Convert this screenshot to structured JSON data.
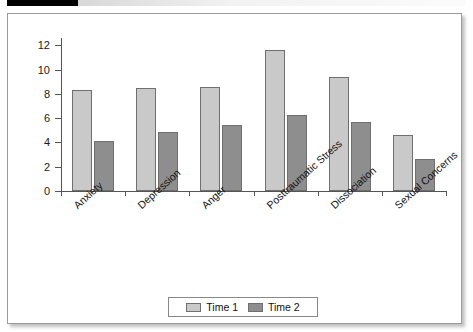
{
  "figure": {
    "marker_bar": "black-tab",
    "background": "#ffffff",
    "border_color": "#9a9a9a"
  },
  "legend": {
    "position": "bottom-center",
    "entries": [
      {
        "label": "Time 1",
        "color": "#c9c9c9"
      },
      {
        "label": "Time 2",
        "color": "#8e8e8e"
      }
    ]
  },
  "chart_data": {
    "type": "bar",
    "title": "",
    "subtitle": "",
    "xlabel": "",
    "ylabel": "",
    "categories": [
      "Anxiety",
      "Depression",
      "Anger",
      "Posttraumatic Stress",
      "Dissociation",
      "Sexual Concerns"
    ],
    "series": [
      {
        "name": "Time 1",
        "color": "#c9c9c9",
        "values": [
          8.3,
          8.5,
          8.6,
          11.6,
          9.35,
          4.65
        ]
      },
      {
        "name": "Time 2",
        "color": "#8e8e8e",
        "values": [
          4.15,
          4.9,
          5.4,
          6.3,
          5.7,
          2.65
        ]
      }
    ],
    "ylim": [
      0,
      12.6
    ],
    "yticks": [
      0,
      2,
      4,
      6,
      8,
      10,
      12
    ],
    "ytick_labels": [
      "0",
      "2",
      "4",
      "6",
      "8",
      "10",
      "12"
    ],
    "grid": false,
    "legend_position": "bottom-center",
    "xtick_label_rotation": -42
  }
}
